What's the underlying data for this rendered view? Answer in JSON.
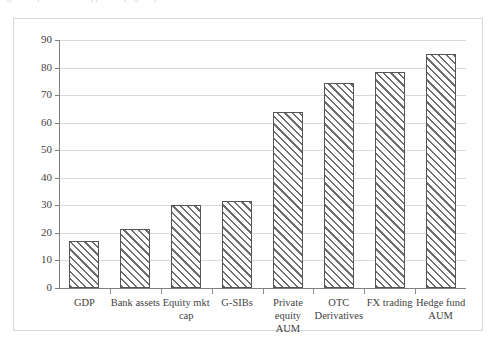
{
  "page": {
    "caption_remnant": "figure caption text clipped at page top"
  },
  "chart": {
    "frame_border_color": "#d6d6d6",
    "gridline_color": "#d9d9d9",
    "axis_color": "#808080",
    "bar_border_color": "#555555",
    "bar_hatch_color": "#6e6e6e",
    "bar_fill_color": "#ffffff"
  },
  "chart_data": {
    "type": "bar",
    "title": "",
    "xlabel": "",
    "ylabel": "",
    "ylim": [
      0,
      90
    ],
    "yticks": [
      0,
      10,
      20,
      30,
      40,
      50,
      60,
      70,
      80,
      90
    ],
    "grid": true,
    "legend": "none",
    "categories": [
      "GDP",
      "Bank assets",
      "Equity mkt cap",
      "G-SIBs",
      "Private equity AUM",
      "OTC Derivatives",
      "FX trading",
      "Hedge fund AUM"
    ],
    "values": [
      17,
      21.5,
      30.3,
      31.5,
      64,
      74.3,
      78.5,
      85
    ],
    "series": [
      {
        "name": "",
        "values": [
          17,
          21.5,
          30.3,
          31.5,
          64,
          74.3,
          78.5,
          85
        ]
      }
    ]
  }
}
